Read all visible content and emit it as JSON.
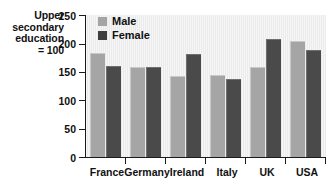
{
  "caption": {
    "line1": "Upper",
    "line2": "secondary",
    "line3": "education",
    "line4": "= 100"
  },
  "legend": {
    "male_label": "Male",
    "female_label": "Female",
    "male_color": "#a5a5a5",
    "female_color": "#3f3f3f"
  },
  "axis": {
    "yticks": [
      "0",
      "50",
      "100",
      "150",
      "200",
      "250"
    ],
    "xlabels": [
      "France",
      "Germany",
      "Ireland",
      "Italy",
      "UK",
      "USA"
    ]
  },
  "chart_data": {
    "type": "bar",
    "title": "",
    "xlabel": "",
    "ylabel": "Upper secondary education = 100",
    "categories": [
      "France",
      "Germany",
      "Ireland",
      "Italy",
      "UK",
      "USA"
    ],
    "series": [
      {
        "name": "Male",
        "color": "#a5a5a5",
        "values": [
          183,
          158,
          143,
          144,
          158,
          204
        ]
      },
      {
        "name": "Female",
        "color": "#3f3f3f",
        "values": [
          161,
          158,
          181,
          137,
          208,
          189
        ]
      }
    ],
    "ylim": [
      0,
      250
    ],
    "yticks": [
      0,
      50,
      100,
      150,
      200,
      250
    ],
    "grid": false,
    "legend_position": "top-left-inside",
    "plot_background": "#ebebeb"
  }
}
